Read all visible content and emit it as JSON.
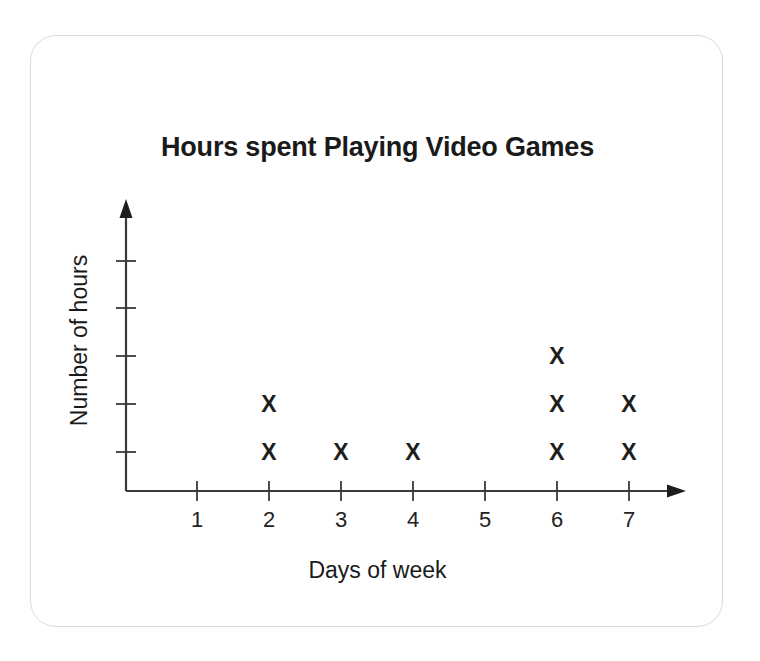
{
  "card": {
    "border_color": "#d8dadc",
    "background": "#ffffff"
  },
  "chart_title": "Hours spent Playing Video Games",
  "axis": {
    "x_label": "Days of week",
    "y_label": "Number of hours",
    "x_tick_labels": [
      "1",
      "2",
      "3",
      "4",
      "5",
      "6",
      "7"
    ],
    "y_tick_labels": [
      "",
      "",
      "",
      "",
      ""
    ],
    "axis_color": "#3a3a3a"
  },
  "marker": {
    "glyph": "X",
    "color": "#1d1d1d"
  },
  "chart_data": {
    "type": "scatter",
    "plot_style": "dot-plot",
    "title": "Hours spent Playing Video Games",
    "xlabel": "Days of week",
    "ylabel": "Number of hours",
    "marker": "X",
    "categories": [
      "1",
      "2",
      "3",
      "4",
      "5",
      "6",
      "7"
    ],
    "values": [
      0,
      2,
      1,
      1,
      0,
      3,
      2
    ],
    "xlim": [
      0,
      7
    ],
    "ylim": [
      0,
      5
    ],
    "y_tick_count": 5,
    "y_ticks_labeled": false,
    "grid": false,
    "legend": false,
    "points": [
      {
        "x": 2,
        "y": 1
      },
      {
        "x": 2,
        "y": 2
      },
      {
        "x": 3,
        "y": 1
      },
      {
        "x": 4,
        "y": 1
      },
      {
        "x": 6,
        "y": 1
      },
      {
        "x": 6,
        "y": 2
      },
      {
        "x": 6,
        "y": 3
      },
      {
        "x": 7,
        "y": 1
      },
      {
        "x": 7,
        "y": 2
      }
    ]
  }
}
